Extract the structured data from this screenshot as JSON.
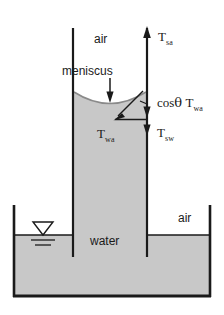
{
  "figure": {
    "type": "physics-schematic",
    "colors": {
      "water_fill": "#c8c8c8",
      "line": "#1a1a1a",
      "background": "#ffffff",
      "meniscus_line": "#8a8a8a"
    }
  },
  "labels": {
    "air_top": "air",
    "air_right": "air",
    "water": "water",
    "meniscus": "meniscus",
    "T_sa": {
      "base": "T",
      "sub": "sa"
    },
    "T_wa_right": {
      "prefix": "cos",
      "theta": "θ",
      "base": "T",
      "sub": "wa"
    },
    "T_wa_inner": {
      "base": "T",
      "sub": "wa"
    },
    "T_sw": {
      "base": "T",
      "sub": "sw"
    }
  },
  "icons": {
    "water_table": "water-table-symbol",
    "arrow_up": "arrow-up-icon",
    "arrow_down": "arrow-down-icon",
    "arrow_diagonal": "arrow-diagonal-icon"
  },
  "geometry": {
    "tube_left_wall_x": 73,
    "tube_right_wall_x": 147,
    "tube_top_y": 28,
    "meniscus_edge_y": 92,
    "meniscus_center_y": 105,
    "tank_left_x": 13,
    "tank_right_x": 211,
    "tank_top_y": 205,
    "tank_bottom_y": 297,
    "water_surface_y": 235,
    "tube_bottom_y": 257
  }
}
